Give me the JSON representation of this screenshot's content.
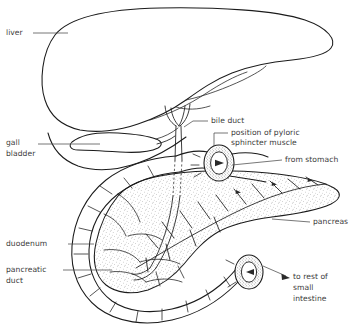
{
  "figure": {
    "background_color": "#ffffff",
    "ink_color": "#1b1b1b",
    "label_color": "#3b3b3b",
    "style": "line drawing with stippled pancreas"
  },
  "labels": {
    "liver": "liver",
    "gall_bladder_line1": "gall",
    "gall_bladder_line2": "bladder",
    "bile_duct": "bile duct",
    "pyloric_line1": "position of pyloric",
    "pyloric_line2": "sphincter muscle",
    "from_stomach": "from stomach",
    "pancreas": "pancreas",
    "duodenum": "duodenum",
    "pancreatic_duct_line1": "pancreatic",
    "pancreatic_duct_line2": "duct",
    "to_rest_line1": "to rest of",
    "to_rest_line2": "small",
    "to_rest_line3": "intestine"
  },
  "structures": [
    {
      "name": "liver",
      "label": "liver",
      "kind": "organ-outline"
    },
    {
      "name": "gall-bladder",
      "label": "gall bladder",
      "kind": "organ-outline"
    },
    {
      "name": "bile-duct",
      "label": "bile duct",
      "kind": "duct"
    },
    {
      "name": "pyloric-sphincter",
      "label": "position of pyloric sphincter muscle",
      "kind": "ring"
    },
    {
      "name": "stomach-inlet",
      "label": "from stomach",
      "kind": "flow-arrow"
    },
    {
      "name": "pancreas",
      "label": "pancreas",
      "kind": "stippled-organ"
    },
    {
      "name": "duodenum",
      "label": "duodenum",
      "kind": "organ-outline"
    },
    {
      "name": "pancreatic-duct",
      "label": "pancreatic duct",
      "kind": "duct"
    },
    {
      "name": "small-intestine-outlet",
      "label": "to rest of small intestine",
      "kind": "flow-arrow"
    }
  ]
}
